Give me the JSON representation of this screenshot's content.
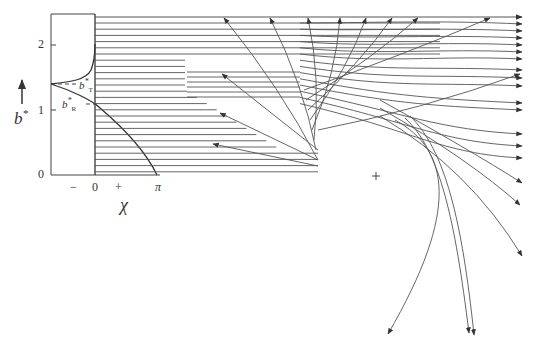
{
  "figure": {
    "type": "ray-scattering-diagram",
    "y_axis": {
      "label": "b*",
      "ticks": [
        "0",
        "1",
        "2"
      ],
      "markers": {
        "rainbow": "b*_R",
        "glory_turning": "b*_T"
      }
    },
    "x_axis": {
      "label": "χ",
      "ticks": [
        "−",
        "0",
        "+",
        "π"
      ]
    },
    "annotations": {
      "b_T": "b",
      "b_T_sub": "T",
      "b_R": "b",
      "b_R_sub": "R",
      "star": "*",
      "center_marker": "+"
    },
    "colors": {
      "line": "#333333",
      "background": "#ffffff"
    }
  },
  "chart_data": {
    "type": "diagram",
    "title": "",
    "xlabel": "χ",
    "ylabel": "b*",
    "y_ticks": [
      0,
      1,
      2
    ],
    "x_ticks": [
      "−",
      "0",
      "+",
      "π"
    ],
    "incident_rays": {
      "count": 25,
      "b_range": [
        0.05,
        2.45
      ]
    },
    "deflection_curve_points": [
      [
        -1,
        1.4
      ],
      [
        0,
        1.1
      ],
      [
        1.55,
        0
      ]
    ],
    "glory_curve_points": [
      [
        -1,
        1.4
      ],
      [
        0,
        2.1
      ]
    ],
    "b_R": 1.1,
    "b_T": 1.4
  }
}
